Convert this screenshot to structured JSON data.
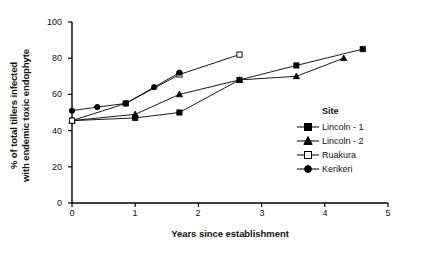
{
  "chart_data": {
    "type": "line",
    "title": "",
    "xlabel": "Years since establishment",
    "ylabel": "% of total tillers infected with endemic toxic endophyte",
    "ylabel_line1": "% of total tillers infected",
    "ylabel_line2": "with endemic toxic endophyte",
    "xlim": [
      0,
      5
    ],
    "ylim": [
      0,
      100
    ],
    "xticks": [
      0,
      1,
      2,
      3,
      4,
      5
    ],
    "yticks": [
      0,
      20,
      40,
      60,
      80,
      100
    ],
    "grid": false,
    "legend_position": "inside-right",
    "legend_title": "Site",
    "series": [
      {
        "name": "Lincoln - 1",
        "marker": "filled-square",
        "color": "#000000",
        "points": [
          {
            "x": 0.0,
            "y": 45.5
          },
          {
            "x": 1.0,
            "y": 47.0
          },
          {
            "x": 1.7,
            "y": 50.0
          },
          {
            "x": 2.65,
            "y": 68.0
          },
          {
            "x": 3.55,
            "y": 76.0
          },
          {
            "x": 4.6,
            "y": 85.0
          }
        ]
      },
      {
        "name": "Lincoln - 2",
        "marker": "filled-triangle",
        "color": "#000000",
        "points": [
          {
            "x": 0.0,
            "y": 45.5
          },
          {
            "x": 1.0,
            "y": 49.0
          },
          {
            "x": 1.7,
            "y": 60.0
          },
          {
            "x": 2.65,
            "y": 68.0
          },
          {
            "x": 3.55,
            "y": 70.0
          },
          {
            "x": 4.3,
            "y": 80.0
          }
        ]
      },
      {
        "name": "Ruakura",
        "marker": "open-square",
        "color": "#000000",
        "points": [
          {
            "x": 0.0,
            "y": 45.5
          },
          {
            "x": 0.85,
            "y": 55.0
          },
          {
            "x": 1.7,
            "y": 71.0
          },
          {
            "x": 2.65,
            "y": 82.0
          }
        ]
      },
      {
        "name": "Kerikeri",
        "marker": "filled-circle",
        "color": "#000000",
        "points": [
          {
            "x": 0.0,
            "y": 51.0
          },
          {
            "x": 0.4,
            "y": 53.0
          },
          {
            "x": 0.85,
            "y": 55.0
          },
          {
            "x": 1.3,
            "y": 64.0
          },
          {
            "x": 1.7,
            "y": 72.0
          }
        ]
      }
    ]
  },
  "axes": {
    "x_tick_labels": [
      "0",
      "1",
      "2",
      "3",
      "4",
      "5"
    ],
    "y_tick_labels": [
      "0",
      "20",
      "40",
      "60",
      "80",
      "100"
    ]
  },
  "legend": {
    "title": "Site",
    "items": [
      {
        "label": "Lincoln - 1",
        "marker": "filled-square"
      },
      {
        "label": "Lincoln - 2",
        "marker": "filled-triangle"
      },
      {
        "label": "Ruakura",
        "marker": "open-square"
      },
      {
        "label": "Kerikeri",
        "marker": "filled-circle"
      }
    ]
  }
}
